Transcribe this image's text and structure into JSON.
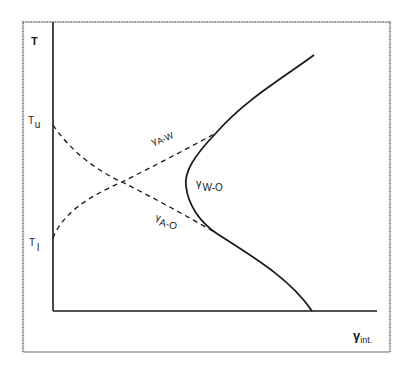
{
  "diagram": {
    "axes": {
      "y_label": "T",
      "x_label_main": "γ",
      "x_label_sub": "int.",
      "y_ticks": [
        {
          "main": "T",
          "sub": "u"
        },
        {
          "main": "T",
          "sub": "l"
        }
      ]
    },
    "curves": [
      {
        "id": "gamma-W-O",
        "style": "solid",
        "label_main": "γ",
        "label_sub": "W-O"
      },
      {
        "id": "gamma-A-W",
        "style": "dashed",
        "label_main": "γ",
        "label_sub": "A-W"
      },
      {
        "id": "gamma-A-O",
        "style": "dashed",
        "label_main": "γ",
        "label_sub": "A-O"
      }
    ],
    "colors": {
      "line": "#1a1a1a",
      "frame": "#8a8a8a",
      "background": "#ffffff"
    }
  }
}
